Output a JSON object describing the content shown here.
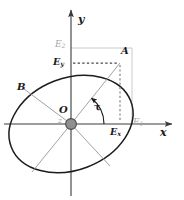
{
  "figure": {
    "colors": {
      "ellipse_stroke": "#1c1c1c",
      "spoke_stroke": "#8c8c8c",
      "axis_stroke": "#3a3a3a",
      "construction_gray": "#bfbfbf",
      "dashed_dark": "#555555",
      "hub_fill": "#8f8f8f",
      "hub_stroke": "#4a4a4a",
      "background": "#ffffff"
    },
    "labels": {
      "y_axis": "y",
      "x_axis": "x",
      "point_a": "A",
      "point_b": "B",
      "origin": "O",
      "z_axis": "z",
      "angle": "τ",
      "e1": "E",
      "e1_sub": "1",
      "e2": "E",
      "e2_sub": "2",
      "ex": "E",
      "ex_sub": "x",
      "ey": "E",
      "ey_sub": "y"
    },
    "geometry": {
      "origin": {
        "x": 71,
        "y": 124
      },
      "point_a": {
        "x": 120,
        "y": 63
      },
      "point_b": {
        "x": 24,
        "y": 89
      },
      "e1_x": 132,
      "e2_y": 48,
      "ex_x": 120,
      "ey_y": 63,
      "ellipse_rx": 64,
      "ellipse_ry": 46,
      "ellipse_rotation_deg": -21,
      "y_axis_top": 10,
      "x_axis_right": 172,
      "angle_tau_deg": 51
    }
  }
}
